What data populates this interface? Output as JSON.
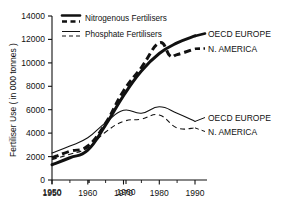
{
  "chart_data": {
    "type": "line",
    "title": "",
    "xlabel": "",
    "ylabel": "Fertiliser Use ( in 000 tonnes )",
    "xlim": [
      1950,
      1992
    ],
    "ylim": [
      0,
      14000
    ],
    "grid": false,
    "x_ticks": [
      1950,
      1960,
      1970,
      1980,
      1990
    ],
    "x_tick_labels": [
      "1950",
      "1960",
      "1970",
      "1980",
      "1990"
    ],
    "x_minor_ticks": [
      1955,
      1965,
      1975,
      1985
    ],
    "y_ticks": [
      0,
      2000,
      4000,
      6000,
      8000,
      10000,
      12000,
      14000
    ],
    "y_tick_labels": [
      "0",
      "2000",
      "4000",
      "6000",
      "8000",
      "10000",
      "12000",
      "14000"
    ],
    "legend_position": "top-left-inside",
    "legend": [
      {
        "label": "Nitrogenous Fertilisers",
        "style": "thick"
      },
      {
        "label": "Phosphate Fertilisers",
        "style": "thin"
      }
    ],
    "series": [
      {
        "name": "Nitrogenous Fertilisers - OECD EUROPE",
        "fertiliser": "Nitrogenous Fertilisers",
        "region": "OECD EUROPE",
        "style": "thick-solid",
        "annotation": "OECD EUROPE",
        "x": [
          1950,
          1955,
          1960,
          1965,
          1970,
          1975,
          1980,
          1985,
          1990
        ],
        "values": [
          1300,
          1900,
          2550,
          4700,
          7200,
          9300,
          10800,
          11700,
          12300
        ]
      },
      {
        "name": "Nitrogenous Fertilisers - N. AMERICA",
        "fertiliser": "Nitrogenous Fertilisers",
        "region": "N. AMERICA",
        "style": "thick-dashed",
        "annotation": "N. AMERICA",
        "x": [
          1950,
          1955,
          1960,
          1965,
          1970,
          1975,
          1980,
          1983,
          1985,
          1990
        ],
        "values": [
          1900,
          2450,
          2900,
          4850,
          7600,
          9600,
          11700,
          10600,
          10700,
          11200
        ]
      },
      {
        "name": "Phosphate Fertilisers - OECD EUROPE",
        "fertiliser": "Phosphate Fertilisers",
        "region": "OECD EUROPE",
        "style": "thin-solid",
        "annotation": "OECD EUROPE",
        "x": [
          1950,
          1955,
          1960,
          1965,
          1970,
          1975,
          1980,
          1985,
          1990
        ],
        "values": [
          2300,
          2900,
          3600,
          4900,
          5950,
          5700,
          6250,
          5700,
          5000
        ]
      },
      {
        "name": "Phosphate Fertilisers - N. AMERICA",
        "fertiliser": "Phosphate Fertilisers",
        "region": "N. AMERICA",
        "style": "thin-dashed",
        "annotation": "N. AMERICA",
        "x": [
          1950,
          1955,
          1960,
          1965,
          1970,
          1975,
          1980,
          1985,
          1990
        ],
        "values": [
          1750,
          2200,
          2750,
          4100,
          5000,
          5200,
          5550,
          4450,
          4450
        ]
      }
    ],
    "annotations": [
      {
        "text": "OECD EUROPE",
        "series": "Nitrogenous Fertilisers - OECD EUROPE"
      },
      {
        "text": "N. AMERICA",
        "series": "Nitrogenous Fertilisers - N. AMERICA"
      },
      {
        "text": "OECD EUROPE",
        "series": "Phosphate Fertilisers - OECD EUROPE"
      },
      {
        "text": "N. AMERICA",
        "series": "Phosphate Fertilisers - N. AMERICA"
      }
    ],
    "colors": {
      "ink": "#111111",
      "background": "#ffffff"
    }
  }
}
